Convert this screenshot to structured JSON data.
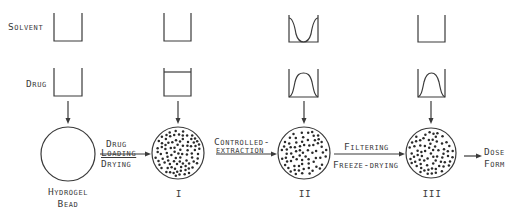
{
  "row_labels": {
    "solvent": "Solvent",
    "drug": "Drug"
  },
  "stages": [
    {
      "id": "start",
      "x": 68,
      "label": [
        "Hydrogel",
        "Bead"
      ],
      "solvent_profile": "empty",
      "drug_profile": "empty",
      "particles": "none"
    },
    {
      "id": "I",
      "x": 178,
      "label": [
        "I"
      ],
      "solvent_profile": "empty",
      "drug_profile": "uniform",
      "particles": "dense-uniform"
    },
    {
      "id": "II",
      "x": 304,
      "label": [
        "II"
      ],
      "solvent_profile": "u-shaped",
      "drug_profile": "bell-shaped",
      "particles": "center-concentrated"
    },
    {
      "id": "III",
      "x": 431,
      "label": [
        "III"
      ],
      "solvent_profile": "empty",
      "drug_profile": "bell-shaped",
      "particles": "center-concentrated"
    }
  ],
  "transitions": [
    {
      "from": "start",
      "to": "I",
      "above": [
        "Drug",
        "Loading"
      ],
      "below": [
        "Drying"
      ]
    },
    {
      "from": "I",
      "to": "II",
      "above": [
        "Controlled-",
        "extraction"
      ],
      "below": []
    },
    {
      "from": "II",
      "to": "III",
      "above": [
        "Filtering"
      ],
      "below": [
        "Freeze-drying"
      ]
    },
    {
      "from": "III",
      "to": "end",
      "above": [],
      "below": []
    }
  ],
  "final_output": [
    "Dose",
    "Form"
  ],
  "colors": {
    "line": "#3a3a3a",
    "dot": "#2a2a2a",
    "background": "#ffffff"
  }
}
